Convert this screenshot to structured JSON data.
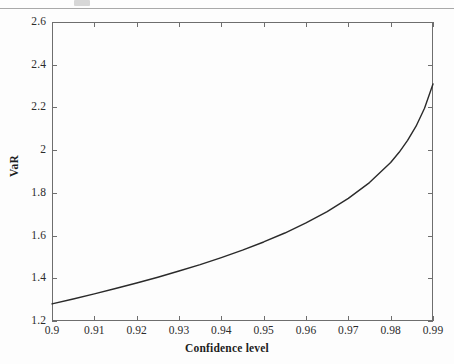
{
  "chart_data": {
    "type": "line",
    "title": "",
    "subtitle": "",
    "xlabel": "Confidence level",
    "ylabel": "VaR",
    "xlim": [
      0.9,
      0.99
    ],
    "ylim": [
      1.2,
      2.6
    ],
    "grid": false,
    "legend": null,
    "legend_position": "none",
    "xticks": [
      0.9,
      0.91,
      0.92,
      0.93,
      0.94,
      0.95,
      0.96,
      0.97,
      0.98,
      0.99
    ],
    "xtick_labels": [
      "0.9",
      "0.91",
      "0.92",
      "0.93",
      "0.94",
      "0.95",
      "0.96",
      "0.97",
      "0.98",
      "0.99"
    ],
    "yticks": [
      1.2,
      1.4,
      1.6,
      1.8,
      2.0,
      2.2,
      2.4,
      2.6
    ],
    "ytick_labels": [
      "1.2",
      "1.4",
      "1.6",
      "1.8",
      "2",
      "2.2",
      "2.4",
      "2.6"
    ],
    "series": [
      {
        "name": "VaR",
        "color": "#2a2a2a",
        "line_width": 1.4,
        "x": [
          0.9,
          0.905,
          0.91,
          0.915,
          0.92,
          0.925,
          0.93,
          0.935,
          0.94,
          0.945,
          0.95,
          0.955,
          0.96,
          0.965,
          0.97,
          0.975,
          0.98,
          0.982,
          0.984,
          0.986,
          0.988,
          0.99
        ],
        "values": [
          1.28,
          1.303,
          1.327,
          1.352,
          1.378,
          1.405,
          1.434,
          1.464,
          1.497,
          1.532,
          1.57,
          1.612,
          1.659,
          1.712,
          1.774,
          1.848,
          1.942,
          1.99,
          2.046,
          2.112,
          2.196,
          2.31
        ]
      }
    ],
    "annotations": []
  },
  "axis": {
    "x_title": "Confidence level",
    "y_title": "VaR",
    "x_labels": [
      "0.9",
      "0.91",
      "0.92",
      "0.93",
      "0.94",
      "0.95",
      "0.96",
      "0.97",
      "0.98",
      "0.99"
    ],
    "y_labels": [
      "2.6",
      "2.4",
      "2.2",
      "2",
      "1.8",
      "1.6",
      "1.4",
      "1.2"
    ]
  },
  "colors": {
    "curve": "#2a2a2a",
    "frame": "#6e6e6e",
    "text": "#1d1d1d",
    "background": "#fdfdfd"
  }
}
